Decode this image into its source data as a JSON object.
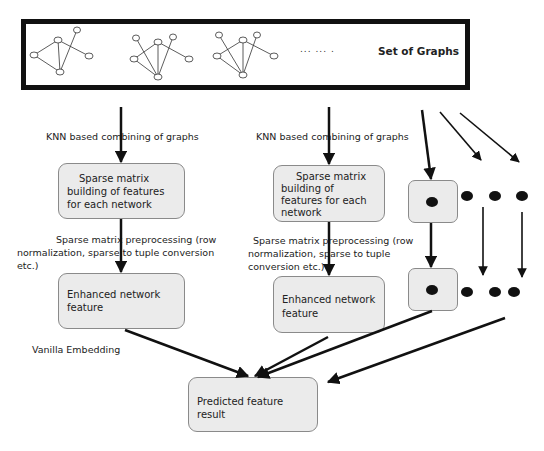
{
  "banner": {
    "title": "Set of Graphs",
    "ellipsis": "... ... .",
    "graph_icons": [
      "graph-1",
      "graph-2",
      "graph-3"
    ]
  },
  "left_column": {
    "step1_label": "KNN based combining of graphs",
    "box1_lines": [
      "Sparse matrix",
      "building of features",
      "for each network"
    ],
    "step2_label_lines": [
      "Sparse matrix preprocessing (row",
      "normalization, sparse to tuple conversion",
      "etc.)"
    ],
    "box2_lines": [
      "Enhanced network",
      "feature"
    ],
    "step3_label": "Vanilla Embedding"
  },
  "middle_column": {
    "step1_label": "KNN based combining of graphs",
    "box1_lines": [
      "Sparse matrix",
      "building of",
      "features for each",
      "network"
    ],
    "step2_label_lines": [
      "Sparse matrix preprocessing (row",
      "normalization, sparse to tuple",
      "conversion etc.)"
    ],
    "box2_lines": [
      "Enhanced  network",
      "feature"
    ]
  },
  "output": {
    "box_lines": [
      "Predicted feature",
      "result"
    ]
  },
  "colors": {
    "box_fill": "#ebebeb",
    "box_border": "#8a8a8a",
    "arrow": "#111111",
    "banner_border": "#111111"
  }
}
